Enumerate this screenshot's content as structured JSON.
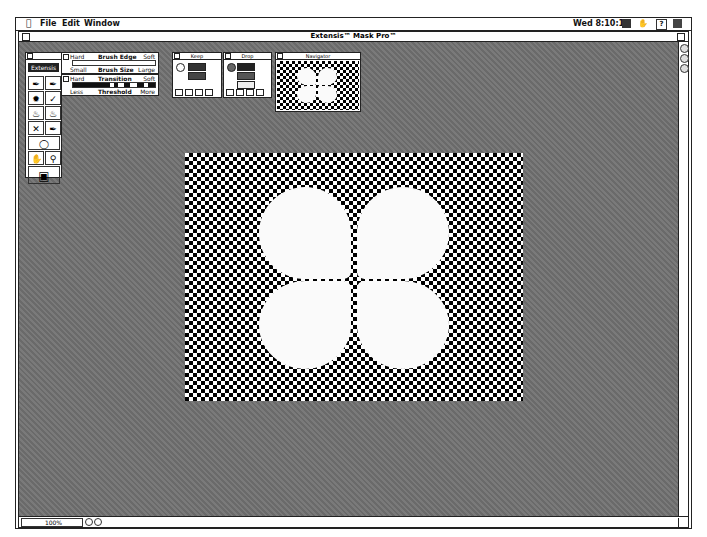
{
  "menubar": {
    "apple_icon": "apple-icon",
    "items": [
      "File",
      "Edit",
      "Window"
    ],
    "clock": "Wed 8:10:17",
    "status_icons": [
      "app-icon",
      "hand-icon",
      "help-icon",
      "application-menu-icon"
    ]
  },
  "window": {
    "title": "Extensis™ Mask Pro™"
  },
  "tools_palette": {
    "brand_label": "Extensis",
    "tools": [
      "keep-dropper-icon",
      "drop-dropper-icon",
      "magic-brush-icon",
      "brush-icon",
      "magic-fill-icon",
      "bucket-icon",
      "magic-pen-icon",
      "pen-icon",
      "magic-wand-icon",
      "hand-icon",
      "zoom-icon",
      "mask-view-icon"
    ]
  },
  "brush_palette": {
    "edge_left": "Hard",
    "edge_title": "Brush Edge",
    "edge_right": "Soft",
    "size_left": "Small",
    "size_title": "Brush Size",
    "size_right": "Large"
  },
  "transition_palette": {
    "left": "Hard",
    "title": "Transition",
    "right": "Soft",
    "threshold_left": "Less",
    "threshold_title": "Threshold",
    "threshold_right": "More"
  },
  "keep_palette": {
    "title": "Keep"
  },
  "drop_palette": {
    "title": "Drop"
  },
  "navigator": {
    "title": "Navigator"
  },
  "status": {
    "zoom": "100%"
  },
  "colors": {
    "background_gray": "#707070",
    "checker_dark": "#000000",
    "checker_light": "#ffffff",
    "mask_white": "#fafafa"
  }
}
